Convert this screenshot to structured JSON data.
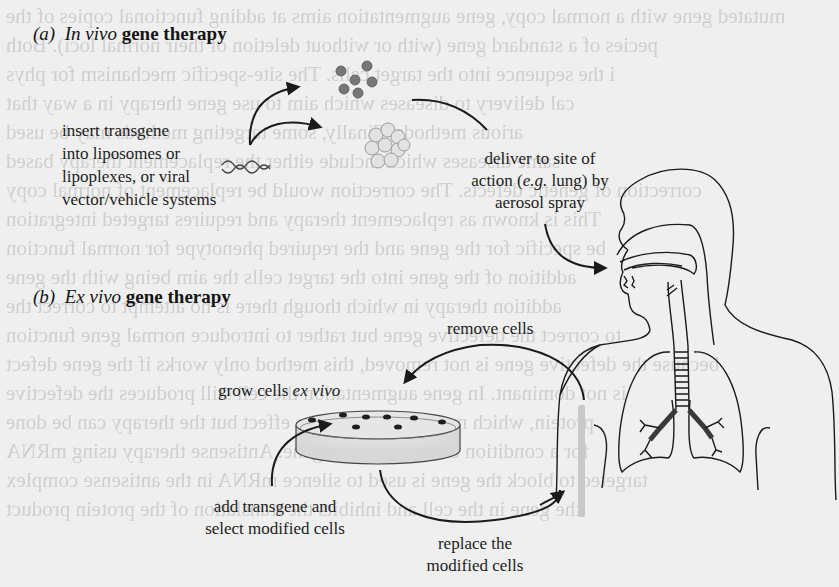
{
  "figure": {
    "section_a": {
      "tag": "(a)",
      "italic": "In vivo",
      "bold": "gene therapy",
      "labels": {
        "insert": [
          "insert transgene",
          "into liposomes or",
          "lipoplexes, or viral",
          "vector/vehicle systems"
        ],
        "deliver_line1": "deliver to site of",
        "deliver_line2_a": "action (",
        "deliver_line2_em": "e.g.",
        "deliver_line2_b": " lung) by",
        "deliver_line3": "aerosol spray"
      }
    },
    "section_b": {
      "tag": "(b)",
      "italic": "Ex vivo",
      "bold": "gene therapy",
      "labels": {
        "remove": "remove cells",
        "grow_prefix": "grow cells ",
        "grow_em": "ex vivo",
        "add_line1": "add transgene and",
        "add_line2": "select modified cells",
        "replace_line1": "replace the",
        "replace_line2": "modified cells"
      }
    },
    "illustrations": [
      "dna-strand-icon",
      "viral-vector-particles-icon",
      "liposome-cluster-icon",
      "human-head-torso-airway-icon",
      "lungs-bronchi-icon",
      "petri-dish-icon"
    ],
    "colors": {
      "paper": "#efefef",
      "ink": "#1a1a1a",
      "bleed_text": "#cfcfcf"
    }
  },
  "background_bleed_text": [
    "mutated gene with a normal copy, gene augmentation aims at adding functional copies of the",
    "pecies of a standard gene (with or without deletion of their normal loci). Both",
    "i the sequence into the target cells. The site-specific mechanism for phys",
    "cal delivery to diseases which aim to use gene therapy in a way that",
    "arious methods. Finally, some targeting methods may be used",
    "same diseases which include either the replacement therapy based",
    "correction of genetic defects. The correction would be replacement of normal copy",
    "This is known as replacement therapy and requires targeted integration",
    "be specific for the gene and the required phenotype for normal function",
    "addition of the gene into the target cells the aim being with the gene",
    "addition therapy in which though there is no attempt to correct the",
    "to correct the defective gene but rather to introduce normal gene function",
    "because the defective gene is not removed, this method only works if the gene defect",
    "is not dominant. In gene augmentation the cell still produces the defective",
    "protein, which may have a negative effect but the therapy can be done",
    "for a condition caused by other gene. Antisense therapy using mRNA",
    "targeted to block the gene is used to silence mRNA in the antisense complex",
    "the gene in the cell and inhibits the translation of the protein product"
  ]
}
